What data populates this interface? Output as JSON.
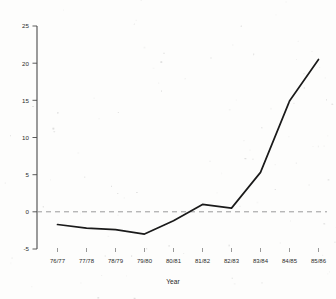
{
  "chart_data": {
    "type": "line",
    "title": "",
    "subtitle": "",
    "xlabel": "Year",
    "ylabel": "",
    "categories": [
      "76/77",
      "77/78",
      "78/79",
      "79/80",
      "80/81",
      "81/82",
      "82/83",
      "83/84",
      "84/85",
      "85/86"
    ],
    "values": [
      -1.7,
      -2.2,
      -2.4,
      -3.0,
      -1.2,
      1.0,
      0.5,
      5.3,
      14.9,
      20.5
    ],
    "series": [
      {
        "name": "",
        "values": [
          -1.7,
          -2.2,
          -2.4,
          -3.0,
          -1.2,
          1.0,
          0.5,
          5.3,
          14.9,
          20.5
        ]
      }
    ],
    "ylim": [
      -5,
      25
    ],
    "yticks": [
      -5,
      0,
      5,
      10,
      15,
      20,
      25
    ],
    "ytick_labels": [
      "-5",
      "0",
      "5",
      "10",
      "15",
      "20",
      "25"
    ],
    "grid": false,
    "legend": false,
    "legend_position": "none",
    "reference_line": {
      "value": 0,
      "style": "dashed",
      "label": ""
    },
    "annotations": []
  },
  "style": {
    "line_color": "#1a1a1a",
    "axis_color": "#4a4a4a",
    "reference_line_color": "#8a8a8a",
    "text_color": "#2b2b2b",
    "background": "#fdfdfc"
  }
}
